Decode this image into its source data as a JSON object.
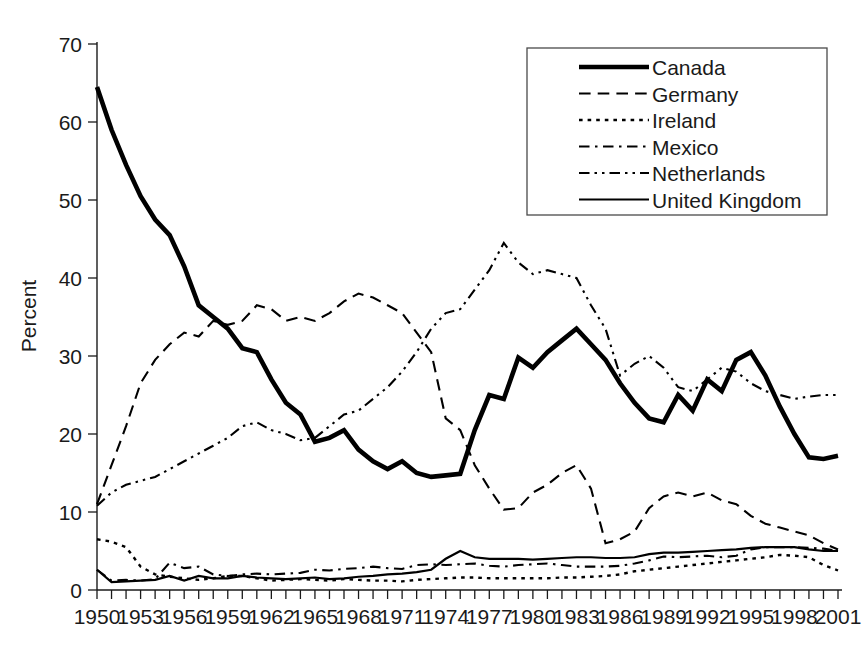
{
  "chart_data": {
    "type": "line",
    "title": "",
    "xlabel": "",
    "ylabel": "Percent",
    "ylim": [
      0,
      70
    ],
    "xlim": [
      1950,
      2001
    ],
    "ytick_step": 10,
    "yticks": [
      0,
      10,
      20,
      30,
      40,
      50,
      60,
      70
    ],
    "xticks": [
      1950,
      1953,
      1956,
      1959,
      1962,
      1965,
      1968,
      1971,
      1974,
      1977,
      1980,
      1983,
      1986,
      1989,
      1992,
      1995,
      1998,
      2001
    ],
    "x": [
      1950,
      1951,
      1952,
      1953,
      1954,
      1955,
      1956,
      1957,
      1958,
      1959,
      1960,
      1961,
      1962,
      1963,
      1964,
      1965,
      1966,
      1967,
      1968,
      1969,
      1970,
      1971,
      1972,
      1973,
      1974,
      1975,
      1976,
      1977,
      1978,
      1979,
      1980,
      1981,
      1982,
      1983,
      1984,
      1985,
      1986,
      1987,
      1988,
      1989,
      1990,
      1991,
      1992,
      1993,
      1994,
      1995,
      1996,
      1997,
      1998,
      1999,
      2000,
      2001
    ],
    "grid": false,
    "legend_position": "top-right",
    "series": [
      {
        "name": "Canada",
        "dash": "solid",
        "width": 4.6,
        "values": [
          64.5,
          59.0,
          54.5,
          50.5,
          47.5,
          45.5,
          41.5,
          36.5,
          35.0,
          33.5,
          31.0,
          30.5,
          27.0,
          24.0,
          22.5,
          19.0,
          19.5,
          20.5,
          18.0,
          16.5,
          15.5,
          16.5,
          15.0,
          14.5,
          14.7,
          14.9,
          20.5,
          25.0,
          24.5,
          29.8,
          28.5,
          30.5,
          32.0,
          33.5,
          31.5,
          29.5,
          26.5,
          24.0,
          22.0,
          21.5,
          25.0,
          23.0,
          27.0,
          25.5,
          29.5,
          30.5,
          27.5,
          23.5,
          20.0,
          17.0,
          16.8,
          17.2
        ]
      },
      {
        "name": "Germany",
        "dash": "dashed",
        "width": 2.1,
        "values": [
          11.0,
          16.0,
          21.0,
          26.5,
          29.5,
          31.5,
          33.0,
          32.5,
          34.5,
          34.0,
          34.5,
          36.5,
          36.0,
          34.5,
          35.0,
          34.5,
          35.5,
          37.0,
          38.0,
          37.5,
          36.5,
          35.5,
          33.0,
          30.5,
          22.0,
          20.5,
          16.0,
          13.0,
          10.3,
          10.5,
          12.5,
          13.5,
          15.0,
          16.0,
          13.0,
          6.0,
          6.5,
          7.5,
          10.5,
          12.0,
          12.5,
          12.0,
          12.5,
          11.5,
          11.0,
          9.5,
          8.5,
          8.0,
          7.5,
          7.0,
          6.0,
          5.2
        ]
      },
      {
        "name": "Ireland",
        "dash": "dotted",
        "width": 2.4,
        "values": [
          6.5,
          6.2,
          5.5,
          3.0,
          2.0,
          1.7,
          1.5,
          1.3,
          1.5,
          1.8,
          1.8,
          1.5,
          1.2,
          1.3,
          1.4,
          1.3,
          1.2,
          1.4,
          1.3,
          1.2,
          1.2,
          1.1,
          1.3,
          1.4,
          1.5,
          1.6,
          1.6,
          1.5,
          1.5,
          1.5,
          1.5,
          1.5,
          1.6,
          1.6,
          1.7,
          1.8,
          2.0,
          2.4,
          2.6,
          2.8,
          3.0,
          3.2,
          3.4,
          3.6,
          3.8,
          4.0,
          4.2,
          4.5,
          4.4,
          4.2,
          3.2,
          2.5
        ]
      },
      {
        "name": "Mexico",
        "dash": "dashdot",
        "width": 2.1,
        "values": [
          2.6,
          1.2,
          1.3,
          1.2,
          1.4,
          3.5,
          2.8,
          3.0,
          2.0,
          1.8,
          2.0,
          2.1,
          2.0,
          2.1,
          2.2,
          2.6,
          2.5,
          2.7,
          2.8,
          3.0,
          2.8,
          2.7,
          3.2,
          3.3,
          3.2,
          3.3,
          3.4,
          3.1,
          3.0,
          3.2,
          3.3,
          3.4,
          3.2,
          3.0,
          3.0,
          3.0,
          3.1,
          3.4,
          3.8,
          4.3,
          4.2,
          4.3,
          4.4,
          4.2,
          4.4,
          5.2,
          5.5,
          5.5,
          5.5,
          5.4,
          5.3,
          5.0
        ]
      },
      {
        "name": "Netherlands",
        "dash": "dashdotdot",
        "width": 2.1,
        "values": [
          10.8,
          12.5,
          13.5,
          14.0,
          14.5,
          15.5,
          16.5,
          17.5,
          18.5,
          19.5,
          21.0,
          21.5,
          20.5,
          20.0,
          19.2,
          19.5,
          21.0,
          22.5,
          23.0,
          24.5,
          26.0,
          28.0,
          30.5,
          33.5,
          35.5,
          36.0,
          38.5,
          41.0,
          44.5,
          42.0,
          40.5,
          41.0,
          40.5,
          40.0,
          36.5,
          33.5,
          27.5,
          29.0,
          30.0,
          28.5,
          26.0,
          25.5,
          27.0,
          28.5,
          28.0,
          26.5,
          25.5,
          25.0,
          24.5,
          24.8,
          25.0,
          25.0
        ]
      },
      {
        "name": "United Kingdom",
        "dash": "solid",
        "width": 2.2,
        "values": [
          2.6,
          1.0,
          1.1,
          1.2,
          1.3,
          1.8,
          1.2,
          1.8,
          1.5,
          1.5,
          1.8,
          1.6,
          1.5,
          1.4,
          1.5,
          1.6,
          1.4,
          1.5,
          1.7,
          1.8,
          2.0,
          2.1,
          2.3,
          2.6,
          4.0,
          5.0,
          4.2,
          4.0,
          4.0,
          4.0,
          3.9,
          4.0,
          4.1,
          4.2,
          4.2,
          4.1,
          4.1,
          4.2,
          4.6,
          4.8,
          4.8,
          4.9,
          5.0,
          5.1,
          5.2,
          5.4,
          5.5,
          5.5,
          5.5,
          5.2,
          5.0,
          5.0
        ]
      }
    ]
  },
  "legend": {
    "entries": [
      {
        "label": "Canada"
      },
      {
        "label": "Germany"
      },
      {
        "label": "Ireland"
      },
      {
        "label": "Mexico"
      },
      {
        "label": "Netherlands"
      },
      {
        "label": "United Kingdom"
      }
    ]
  },
  "colors": {
    "line": "#000000",
    "axis": "#1a1a1a",
    "background": "#ffffff",
    "legend_border": "#4a4a4a"
  }
}
